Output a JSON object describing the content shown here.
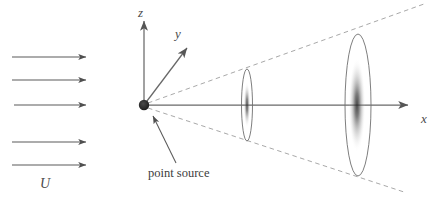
{
  "figure": {
    "background_color": "#ffffff",
    "line_color": "#555555",
    "dashed_color": "#9a9a9a",
    "spot_color": "#3a3a3a",
    "width": 442,
    "height": 208
  },
  "labels": {
    "z_axis": "z",
    "y_axis": "y",
    "x_axis": "x",
    "flow_velocity": "U",
    "point_source": "point source"
  },
  "flow_arrows": {
    "count": 5,
    "x_start": 12,
    "x_end": 88,
    "rows_y": [
      57,
      80,
      105,
      142,
      165
    ],
    "label": "U"
  },
  "axes": {
    "origin": {
      "x": 144,
      "y": 105
    },
    "z": {
      "tip_x": 144,
      "tip_y": 17,
      "label": "z"
    },
    "y": {
      "tip_x": 190,
      "tip_y": 45,
      "label": "y"
    },
    "x": {
      "tip_x": 412,
      "tip_y": 105,
      "label": "x"
    }
  },
  "cone": {
    "apex": {
      "x": 144,
      "y": 105
    },
    "upper_end": {
      "x": 424,
      "y": 4
    },
    "lower_end": {
      "x": 404,
      "y": 192
    },
    "style": "dashed"
  },
  "screens": [
    {
      "name": "near-screen",
      "center_x": 247,
      "center_y": 105,
      "rx": 5.5,
      "ry": 36,
      "spot_ry": 22,
      "spot_rx": 3.2,
      "intensity": 0.72
    },
    {
      "name": "far-screen",
      "center_x": 358,
      "center_y": 105,
      "rx": 13,
      "ry": 71,
      "spot_ry": 46,
      "spot_rx": 8,
      "intensity": 0.82
    }
  ],
  "point_source": {
    "dot_x": 144,
    "dot_y": 105,
    "dot_r": 5.2,
    "caption": "point source",
    "caption_x": 148,
    "caption_y": 168,
    "pointer_from": {
      "x": 175,
      "y": 163
    },
    "pointer_to": {
      "x": 152,
      "y": 115
    }
  }
}
